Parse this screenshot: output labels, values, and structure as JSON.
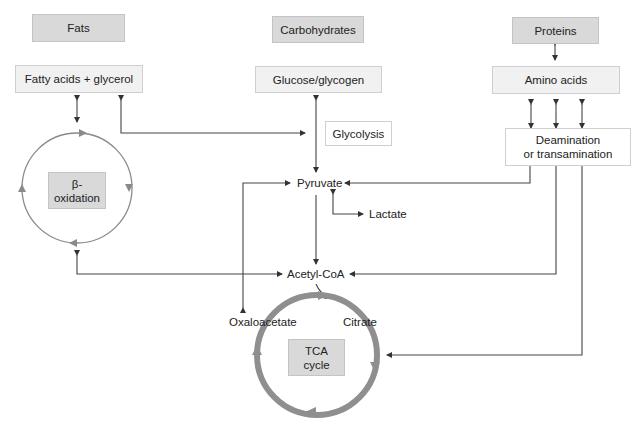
{
  "diagram": {
    "sources": {
      "fats": "Fats",
      "carbohydrates": "Carbohydrates",
      "proteins": "Proteins"
    },
    "intermediates": {
      "fatty_acids": "Fatty acids + glycerol",
      "glucose": "Glucose/glycogen",
      "amino_acids": "Amino acids",
      "glycolysis": "Glycolysis",
      "deamination_line1": "Deamination",
      "deamination_line2": "or transamination"
    },
    "cycles": {
      "beta_line1": "β-",
      "beta_line2": "oxidation",
      "tca_line1": "TCA",
      "tca_line2": "cycle"
    },
    "metabolites": {
      "pyruvate": "Pyruvate",
      "lactate": "Lactate",
      "acetyl_coa": "Acetyl-CoA",
      "oxaloacetate": "Oxaloacetate",
      "citrate": "Citrate"
    },
    "colors": {
      "source_box": "#d9d9d9",
      "intermediate_box": "#f1f1f1",
      "arrow": "#333333",
      "beta_cycle_ring": "#8a8a8a",
      "tca_cycle_ring": "#8f8f8f"
    }
  }
}
